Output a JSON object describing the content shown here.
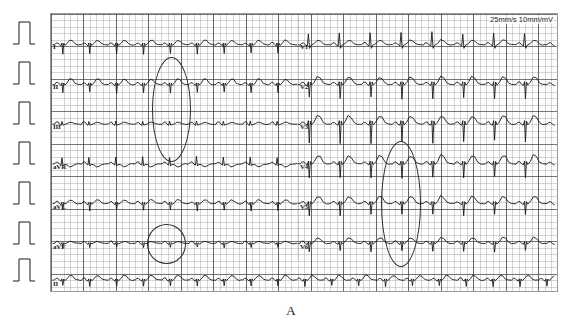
{
  "figure": {
    "panel_letter": "A",
    "type": "12-lead electrocardiogram",
    "speed_gain_caption": "25mm/s 10mm/mV",
    "paper_speed": "25mm/s",
    "gain": "10mm/mV",
    "grid_colors": {
      "small_square": "#787880",
      "large_square": "#3c3c44",
      "paper_background": "#fdfdfd",
      "trace": "#1a1a1a",
      "annotation": "#2a2a2a"
    }
  },
  "rows": [
    {
      "index": 0,
      "baseline_y": 44,
      "left_lead": "I",
      "right_lead": "V1"
    },
    {
      "index": 1,
      "baseline_y": 84,
      "left_lead": "II",
      "right_lead": "V2"
    },
    {
      "index": 2,
      "baseline_y": 124,
      "left_lead": "III",
      "right_lead": "V3"
    },
    {
      "index": 3,
      "baseline_y": 164,
      "left_lead": "aVR",
      "right_lead": "V4"
    },
    {
      "index": 4,
      "baseline_y": 204,
      "left_lead": "aVL",
      "right_lead": "V5"
    },
    {
      "index": 5,
      "baseline_y": 244,
      "left_lead": "aVF",
      "right_lead": "V6"
    },
    {
      "index": 6,
      "baseline_y": 281,
      "left_lead": "II",
      "right_lead": ""
    }
  ],
  "lead_labels": [
    {
      "name": "I",
      "x": 53,
      "y": 45
    },
    {
      "name": "II",
      "x": 53,
      "y": 85
    },
    {
      "name": "III",
      "x": 53,
      "y": 125
    },
    {
      "name": "aVR",
      "x": 53,
      "y": 165
    },
    {
      "name": "aVL",
      "x": 53,
      "y": 205
    },
    {
      "name": "aVF",
      "x": 53,
      "y": 245
    },
    {
      "name": "II",
      "x": 53,
      "y": 282
    },
    {
      "name": "V1",
      "x": 300,
      "y": 45
    },
    {
      "name": "V2",
      "x": 300,
      "y": 85
    },
    {
      "name": "V3",
      "x": 300,
      "y": 125
    },
    {
      "name": "V4",
      "x": 300,
      "y": 165
    },
    {
      "name": "V5",
      "x": 300,
      "y": 205
    },
    {
      "name": "V6",
      "x": 300,
      "y": 245
    }
  ],
  "calibration_pulses": [
    {
      "row": 0,
      "x": 24,
      "baseline_y": 44
    },
    {
      "row": 1,
      "x": 24,
      "baseline_y": 84
    },
    {
      "row": 2,
      "x": 24,
      "baseline_y": 124
    },
    {
      "row": 3,
      "x": 24,
      "baseline_y": 164
    },
    {
      "row": 4,
      "x": 24,
      "baseline_y": 204
    },
    {
      "row": 5,
      "x": 24,
      "baseline_y": 244
    },
    {
      "row": 6,
      "x": 24,
      "baseline_y": 281
    }
  ],
  "annotations": [
    {
      "id": "ellipse-left-upper",
      "shape": "ellipse",
      "x": 152,
      "y": 57,
      "w": 37,
      "h": 103
    },
    {
      "id": "ellipse-left-lower",
      "shape": "circle",
      "x": 147,
      "y": 224,
      "w": 37,
      "h": 38
    },
    {
      "id": "ellipse-right",
      "shape": "ellipse",
      "x": 381,
      "y": 141,
      "w": 38,
      "h": 124
    }
  ],
  "chart_data": {
    "type": "line",
    "xlabel": "time",
    "ylabel": "amplitude (mV)",
    "paper_speed_mm_per_s": 25,
    "gain_mm_per_mV": 10,
    "grid": true,
    "legend": "none",
    "beats_per_row_left": 9,
    "beats_per_row_right": 8,
    "rhythm_strip_lead": "II",
    "series": [
      {
        "name": "I",
        "segment": "left",
        "baseline_y": 44,
        "qrs_direction": "negative",
        "qrs_amp": -9,
        "t_amp": 5,
        "beat_spacing": 27
      },
      {
        "name": "II",
        "segment": "left",
        "baseline_y": 84,
        "qrs_direction": "negative",
        "qrs_amp": -8,
        "t_amp": 6,
        "beat_spacing": 27
      },
      {
        "name": "III",
        "segment": "left",
        "baseline_y": 124,
        "qrs_direction": "positive",
        "qrs_amp": 3,
        "t_amp": 2,
        "beat_spacing": 27
      },
      {
        "name": "aVR",
        "segment": "left",
        "baseline_y": 164,
        "qrs_direction": "positive",
        "qrs_amp": 7,
        "t_amp": -3,
        "beat_spacing": 27
      },
      {
        "name": "aVL",
        "segment": "left",
        "baseline_y": 204,
        "qrs_direction": "negative",
        "qrs_amp": -7,
        "t_amp": 4,
        "beat_spacing": 27
      },
      {
        "name": "aVF",
        "segment": "left",
        "baseline_y": 244,
        "qrs_direction": "negative",
        "qrs_amp": -4,
        "t_amp": 2,
        "beat_spacing": 27
      },
      {
        "name": "II-rhythm",
        "segment": "full",
        "baseline_y": 281,
        "qrs_direction": "mixed",
        "qrs_amp": -6,
        "t_amp": 5,
        "beat_spacing": 27
      },
      {
        "name": "V1",
        "segment": "right",
        "baseline_y": 44,
        "qrs_direction": "positive",
        "qrs_amp": 12,
        "t_amp": 5,
        "beat_spacing": 31
      },
      {
        "name": "V2",
        "segment": "right",
        "baseline_y": 84,
        "qrs_direction": "negative",
        "qrs_amp": -14,
        "t_amp": 8,
        "beat_spacing": 31
      },
      {
        "name": "V3",
        "segment": "right",
        "baseline_y": 124,
        "qrs_direction": "negative",
        "qrs_amp": -18,
        "t_amp": 9,
        "beat_spacing": 31
      },
      {
        "name": "V4",
        "segment": "right",
        "baseline_y": 164,
        "qrs_direction": "negative",
        "qrs_amp": -14,
        "t_amp": 9,
        "beat_spacing": 31
      },
      {
        "name": "V5",
        "segment": "right",
        "baseline_y": 204,
        "qrs_direction": "negative",
        "qrs_amp": -11,
        "t_amp": 8,
        "beat_spacing": 31
      },
      {
        "name": "V6",
        "segment": "right",
        "baseline_y": 244,
        "qrs_direction": "negative",
        "qrs_amp": -8,
        "t_amp": 6,
        "beat_spacing": 31
      }
    ]
  }
}
